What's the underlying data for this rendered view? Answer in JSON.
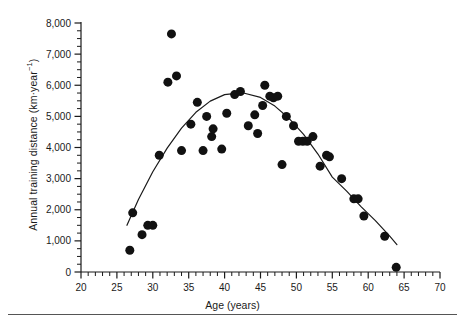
{
  "figure": {
    "xlabel": "Age (years)",
    "ylabel_main": "Annual training distance (km·year",
    "ylabel_sup": "−1",
    "ylabel_close": ")",
    "ylabel_full": "Annual training distance (km·year−1)"
  },
  "axes": {
    "x_ticks": [
      "20",
      "25",
      "30",
      "35",
      "40",
      "45",
      "50",
      "55",
      "60",
      "65",
      "70"
    ],
    "y_ticks": [
      "0",
      "1,000",
      "2,000",
      "3,000",
      "4,000",
      "5,000",
      "6,000",
      "7,000",
      "8,000"
    ]
  },
  "chart_data": {
    "type": "scatter",
    "title": "",
    "xlabel": "Age (years)",
    "ylabel": "Annual training distance (km·year−1)",
    "xlim": [
      20,
      70
    ],
    "ylim": [
      0,
      8000
    ],
    "x_major_tick_interval": 5,
    "x_minor_tick_interval": 1,
    "y_major_tick_interval": 1000,
    "y_minor_tick_interval": 250,
    "grid": false,
    "legend": null,
    "marker": {
      "shape": "circle",
      "color": "#111111",
      "size_px": 9
    },
    "points": [
      {
        "x": 26.8,
        "y": 700
      },
      {
        "x": 27.2,
        "y": 1900
      },
      {
        "x": 28.5,
        "y": 1200
      },
      {
        "x": 29.3,
        "y": 1500
      },
      {
        "x": 30.0,
        "y": 1500
      },
      {
        "x": 30.9,
        "y": 3750
      },
      {
        "x": 32.1,
        "y": 6100
      },
      {
        "x": 32.6,
        "y": 7650
      },
      {
        "x": 33.3,
        "y": 6300
      },
      {
        "x": 34.0,
        "y": 3900
      },
      {
        "x": 35.3,
        "y": 4750
      },
      {
        "x": 36.2,
        "y": 5450
      },
      {
        "x": 37.0,
        "y": 3900
      },
      {
        "x": 37.5,
        "y": 5000
      },
      {
        "x": 38.2,
        "y": 4350
      },
      {
        "x": 38.4,
        "y": 4600
      },
      {
        "x": 39.6,
        "y": 3950
      },
      {
        "x": 40.3,
        "y": 5100
      },
      {
        "x": 41.4,
        "y": 5700
      },
      {
        "x": 42.2,
        "y": 5800
      },
      {
        "x": 43.3,
        "y": 4700
      },
      {
        "x": 44.2,
        "y": 5050
      },
      {
        "x": 44.6,
        "y": 4450
      },
      {
        "x": 45.3,
        "y": 5350
      },
      {
        "x": 45.6,
        "y": 6000
      },
      {
        "x": 46.3,
        "y": 5650
      },
      {
        "x": 46.8,
        "y": 5600
      },
      {
        "x": 47.4,
        "y": 5650
      },
      {
        "x": 48.0,
        "y": 3450
      },
      {
        "x": 48.6,
        "y": 5000
      },
      {
        "x": 49.6,
        "y": 4700
      },
      {
        "x": 50.3,
        "y": 4200
      },
      {
        "x": 50.9,
        "y": 4200
      },
      {
        "x": 51.5,
        "y": 4200
      },
      {
        "x": 52.3,
        "y": 4350
      },
      {
        "x": 53.3,
        "y": 3400
      },
      {
        "x": 54.2,
        "y": 3750
      },
      {
        "x": 54.6,
        "y": 3700
      },
      {
        "x": 56.3,
        "y": 3000
      },
      {
        "x": 58.0,
        "y": 2350
      },
      {
        "x": 58.6,
        "y": 2350
      },
      {
        "x": 59.4,
        "y": 1800
      },
      {
        "x": 62.3,
        "y": 1150
      },
      {
        "x": 63.9,
        "y": 150
      }
    ],
    "fit_curve": {
      "type": "quadratic",
      "description": "fitted second-order polynomial trend line",
      "x_range": [
        26.4,
        64.0
      ],
      "vertex": {
        "x": 42.5,
        "y": 5750
      },
      "points": [
        {
          "x": 26.4,
          "y": 1500
        },
        {
          "x": 28.0,
          "y": 2330
        },
        {
          "x": 30.0,
          "y": 3220
        },
        {
          "x": 32.0,
          "y": 3980
        },
        {
          "x": 34.0,
          "y": 4620
        },
        {
          "x": 36.0,
          "y": 5130
        },
        {
          "x": 38.0,
          "y": 5490
        },
        {
          "x": 40.0,
          "y": 5700
        },
        {
          "x": 42.5,
          "y": 5760
        },
        {
          "x": 45.0,
          "y": 5610
        },
        {
          "x": 47.0,
          "y": 5330
        },
        {
          "x": 49.0,
          "y": 4930
        },
        {
          "x": 51.0,
          "y": 4420
        },
        {
          "x": 53.0,
          "y": 3790
        },
        {
          "x": 55.0,
          "y": 3050
        },
        {
          "x": 57.0,
          "y": 2600
        },
        {
          "x": 59.0,
          "y": 2100
        },
        {
          "x": 61.0,
          "y": 1650
        },
        {
          "x": 63.0,
          "y": 1150
        },
        {
          "x": 64.0,
          "y": 880
        }
      ]
    }
  }
}
